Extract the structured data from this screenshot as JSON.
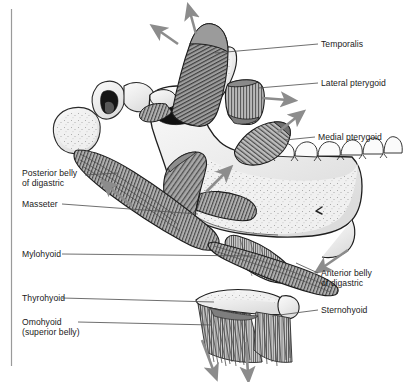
{
  "figure": {
    "background_color": "#ffffff",
    "ink_color": "#1a1a1a",
    "rule_color": "#9a9a9a",
    "bone_fill": "#efefef",
    "muscle_light": "#c9c9c9",
    "muscle_dark": "#6e6e6e",
    "arrow_color": "#8c8c8c"
  },
  "labels": {
    "temporalis": "Temporalis",
    "lateral_pterygoid": "Lateral pterygoid",
    "medial_pterygoid": "Medial pterygoid",
    "posterior_belly_digastric_line1": "Posterior belly",
    "posterior_belly_digastric_line2": "of digastric",
    "masseter": "Masseter",
    "mylohyoid": "Mylohyoid",
    "thyrohyoid": "Thyrohyoid",
    "omohyoid_line1": "Omohyoid",
    "omohyoid_line2": "(superior belly)",
    "anterior_belly_digastric_line1": "Anterior belly",
    "anterior_belly_digastric_line2": "of digastric",
    "sternohyoid": "Sternohyoid"
  },
  "structures": [
    {
      "name": "temporalis",
      "label": "Temporalis",
      "side": "right",
      "arrows": 2
    },
    {
      "name": "lateral-pterygoid",
      "label": "Lateral pterygoid",
      "side": "right",
      "arrows": 1
    },
    {
      "name": "medial-pterygoid",
      "label": "Medial pterygoid",
      "side": "right",
      "arrows": 1
    },
    {
      "name": "posterior-belly-of-digastric",
      "label": "Posterior belly of digastric",
      "side": "left",
      "arrows": 1
    },
    {
      "name": "masseter",
      "label": "Masseter",
      "side": "left",
      "arrows": 1
    },
    {
      "name": "mylohyoid",
      "label": "Mylohyoid",
      "side": "left",
      "arrows": 0
    },
    {
      "name": "thyrohyoid",
      "label": "Thyrohyoid",
      "side": "left",
      "arrows": 0
    },
    {
      "name": "omohyoid-superior-belly",
      "label": "Omohyoid (superior belly)",
      "side": "left",
      "arrows": 1
    },
    {
      "name": "anterior-belly-of-digastric",
      "label": "Anterior belly of digastric",
      "side": "right",
      "arrows": 1
    },
    {
      "name": "sternohyoid",
      "label": "Sternohyoid",
      "side": "right",
      "arrows": 1
    }
  ]
}
